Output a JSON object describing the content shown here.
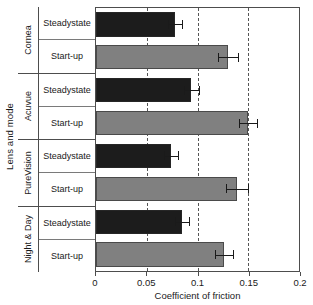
{
  "chart_data": {
    "type": "bar",
    "orientation": "horizontal",
    "title": "",
    "xlabel": "Coefficient of friction",
    "ylabel": "Lens and mode",
    "xlim": [
      0,
      0.2
    ],
    "xticks": [
      0,
      0.05,
      0.1,
      0.15,
      0.2
    ],
    "xticklabels": [
      "0",
      "0.05",
      "0.1",
      "0.15",
      "0.2"
    ],
    "grid": "vertical-dashed",
    "legend": "none",
    "categories": [
      "Cornea",
      "Acuvue",
      "PureVision",
      "Night & Day"
    ],
    "modes": [
      "Steady state",
      "Start-up"
    ],
    "groups": [
      {
        "label": "Cornea",
        "bars": [
          {
            "mode": "Steady state",
            "mode_line1": "Steady",
            "mode_line2": "state",
            "value": 0.078,
            "error": 0.007,
            "color": "#1c1c1c",
            "style": "steady"
          },
          {
            "mode": "Start-up",
            "mode_line1": "Start-up",
            "mode_line2": "",
            "value": 0.13,
            "error": 0.01,
            "color": "#808080",
            "style": "startup"
          }
        ]
      },
      {
        "label": "Acuvue",
        "bars": [
          {
            "mode": "Steady state",
            "mode_line1": "Steady",
            "mode_line2": "state",
            "value": 0.094,
            "error": 0.007,
            "color": "#1c1c1c",
            "style": "steady"
          },
          {
            "mode": "Start-up",
            "mode_line1": "Start-up",
            "mode_line2": "",
            "value": 0.15,
            "error": 0.009,
            "color": "#808080",
            "style": "startup"
          }
        ]
      },
      {
        "label": "PureVision",
        "bars": [
          {
            "mode": "Steady state",
            "mode_line1": "Steady",
            "mode_line2": "state",
            "value": 0.074,
            "error": 0.007,
            "color": "#1c1c1c",
            "style": "steady"
          },
          {
            "mode": "Start-up",
            "mode_line1": "Start-up",
            "mode_line2": "",
            "value": 0.139,
            "error": 0.011,
            "color": "#808080",
            "style": "startup"
          }
        ]
      },
      {
        "label": "Night & Day",
        "bars": [
          {
            "mode": "Steady state",
            "mode_line1": "Steady",
            "mode_line2": "state",
            "value": 0.085,
            "error": 0.007,
            "color": "#1c1c1c",
            "style": "steady"
          },
          {
            "mode": "Start-up",
            "mode_line1": "Start-up",
            "mode_line2": "",
            "value": 0.126,
            "error": 0.009,
            "color": "#808080",
            "style": "startup"
          }
        ]
      }
    ]
  }
}
